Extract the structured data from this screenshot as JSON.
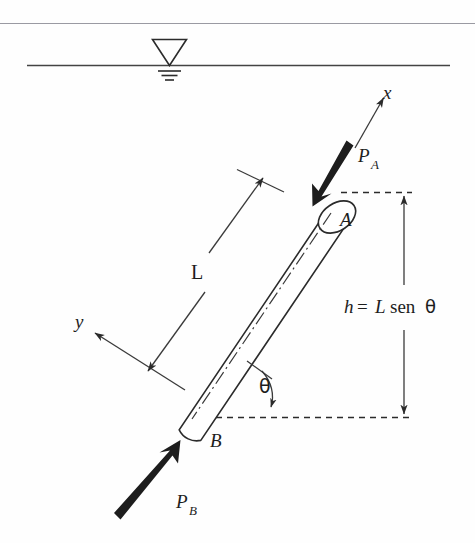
{
  "figure": {
    "background_color": "#fefefe",
    "ink_color": "#2b2b2b"
  },
  "water_surface": {
    "symbol_name": "water-table-triangle",
    "line_color": "#444444"
  },
  "labels": {
    "axis_x": "x",
    "axis_y": "y",
    "point_a": "A",
    "point_b": "B",
    "length": "L",
    "angle": "θ",
    "force_a_symbol": "P",
    "force_a_subscript": "A",
    "force_b_symbol": "P",
    "force_b_subscript": "B",
    "height_expression": {
      "var": "h",
      "equals": "=",
      "length_var": "L",
      "function": "sen",
      "angle": "θ",
      "full": "h = L sen θ"
    }
  },
  "annotations": {
    "dimension_length_name": "L",
    "dimension_height_name": "h",
    "angle_name": "theta"
  }
}
